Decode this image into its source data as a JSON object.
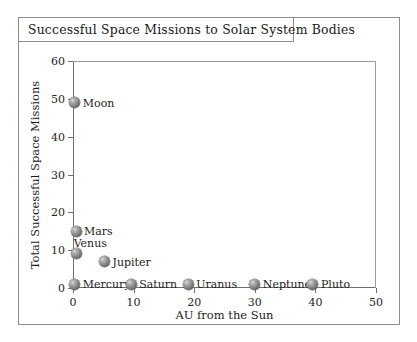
{
  "figure": {
    "title": "Successful Space Missions to Solar System Bodies"
  },
  "chart_data": {
    "type": "scatter",
    "title": "Successful Space Missions to Solar System Bodies",
    "xlabel": "AU from the Sun",
    "ylabel": "Total Successful Space Missions",
    "xlim": [
      0,
      50
    ],
    "ylim": [
      0,
      60
    ],
    "xticks": [
      0,
      10,
      20,
      30,
      40,
      50
    ],
    "yticks": [
      0,
      10,
      20,
      30,
      40,
      50,
      60
    ],
    "xtick_labels": [
      "0",
      "10",
      "20",
      "30",
      "40",
      "50"
    ],
    "ytick_labels": [
      "0",
      "10",
      "20",
      "30",
      "40",
      "50",
      "60"
    ],
    "grid": false,
    "legend": "none",
    "marker_style": "shaded-gray-sphere",
    "points": [
      {
        "name": "Moon",
        "x": 0.3,
        "y": 49,
        "label_pos": "right"
      },
      {
        "name": "Mars",
        "x": 0.5,
        "y": 15,
        "label_pos": "right"
      },
      {
        "name": "Venus",
        "x": 0.6,
        "y": 9,
        "label_pos": "above-right"
      },
      {
        "name": "Jupiter",
        "x": 5.2,
        "y": 7,
        "label_pos": "right"
      },
      {
        "name": "Mercury",
        "x": 0.3,
        "y": 1,
        "label_pos": "right"
      },
      {
        "name": "Saturn",
        "x": 9.6,
        "y": 1,
        "label_pos": "right"
      },
      {
        "name": "Uranus",
        "x": 19.0,
        "y": 1,
        "label_pos": "right"
      },
      {
        "name": "Neptune",
        "x": 30.0,
        "y": 1,
        "label_pos": "right"
      },
      {
        "name": "Pluto",
        "x": 39.6,
        "y": 1,
        "label_pos": "right"
      }
    ]
  }
}
